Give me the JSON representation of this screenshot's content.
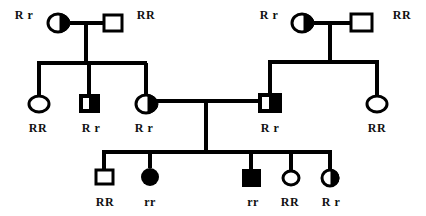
{
  "colors": {
    "stroke": "#000000",
    "fill_affected": "#000000",
    "background": "#ffffff"
  },
  "generations": [
    {
      "id": "I",
      "individuals": [
        {
          "id": "I-1",
          "sex": "female",
          "status": "carrier",
          "genotype": "R r"
        },
        {
          "id": "I-2",
          "sex": "male",
          "status": "unaffected",
          "genotype": "RR"
        },
        {
          "id": "I-3",
          "sex": "female",
          "status": "carrier",
          "genotype": "R r"
        },
        {
          "id": "I-4",
          "sex": "male",
          "status": "unaffected",
          "genotype": "RR"
        }
      ]
    },
    {
      "id": "II",
      "individuals": [
        {
          "id": "II-1",
          "sex": "female",
          "status": "unaffected",
          "genotype": "RR"
        },
        {
          "id": "II-2",
          "sex": "male",
          "status": "carrier",
          "genotype": "R r"
        },
        {
          "id": "II-3",
          "sex": "female",
          "status": "carrier",
          "genotype": "R r"
        },
        {
          "id": "II-4",
          "sex": "male",
          "status": "carrier",
          "genotype": "R r"
        },
        {
          "id": "II-5",
          "sex": "female",
          "status": "unaffected",
          "genotype": "RR"
        }
      ]
    },
    {
      "id": "III",
      "individuals": [
        {
          "id": "III-1",
          "sex": "male",
          "status": "unaffected",
          "genotype": "RR"
        },
        {
          "id": "III-2",
          "sex": "female",
          "status": "affected",
          "genotype": "rr"
        },
        {
          "id": "III-3",
          "sex": "male",
          "status": "affected",
          "genotype": "rr"
        },
        {
          "id": "III-4",
          "sex": "female",
          "status": "unaffected",
          "genotype": "RR"
        },
        {
          "id": "III-5",
          "sex": "female",
          "status": "carrier",
          "genotype": "R r"
        }
      ]
    }
  ]
}
